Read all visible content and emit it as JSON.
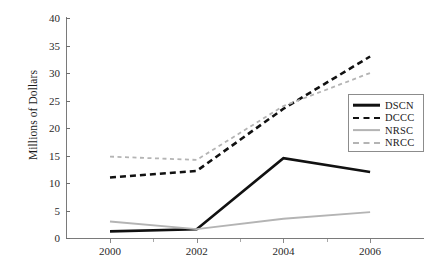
{
  "chart_data": {
    "type": "line",
    "title": "",
    "xlabel": "",
    "ylabel": "Millions of Dollars",
    "x": [
      2000,
      2002,
      2004,
      2006
    ],
    "xtick_labels": [
      "2000",
      "2002",
      "2004",
      "2006"
    ],
    "ytick_labels": [
      "0",
      "5",
      "10",
      "15",
      "20",
      "25",
      "30",
      "35",
      "40"
    ],
    "ytick_values": [
      0,
      5,
      10,
      15,
      20,
      25,
      30,
      35,
      40
    ],
    "xlim": [
      1999,
      2007
    ],
    "ylim": [
      0,
      40
    ],
    "grid": false,
    "legend_position": "right",
    "series": [
      {
        "name": "DSCN",
        "values": [
          1.2,
          1.6,
          14.5,
          12.0
        ],
        "color": "#111111",
        "style": "solid",
        "width": 2.6
      },
      {
        "name": "DCCC",
        "values": [
          11.0,
          12.2,
          23.5,
          33.0
        ],
        "color": "#111111",
        "style": "dashed",
        "width": 2.6
      },
      {
        "name": "NRSC",
        "values": [
          3.0,
          1.6,
          3.5,
          4.7
        ],
        "color": "#b4b4b4",
        "style": "solid",
        "width": 1.8
      },
      {
        "name": "NRCC",
        "values": [
          14.8,
          14.2,
          24.0,
          30.0
        ],
        "color": "#b4b4b4",
        "style": "dashed",
        "width": 1.8
      }
    ]
  },
  "legend": {
    "entries": [
      {
        "label": "DSCN"
      },
      {
        "label": "DCCC"
      },
      {
        "label": "NRSC"
      },
      {
        "label": "NRCC"
      }
    ]
  },
  "axes": {
    "y_title": "Millions of Dollars"
  }
}
